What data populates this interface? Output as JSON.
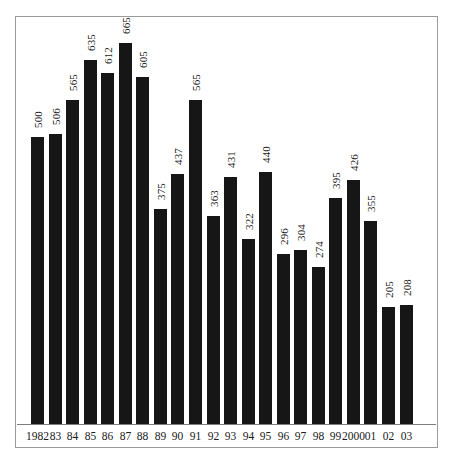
{
  "chart_data": {
    "type": "bar",
    "title": "",
    "subtitle": "",
    "xlabel": "",
    "ylabel": "",
    "grid": false,
    "legend": "none",
    "axis_ranges": {
      "ylim": [
        0,
        700
      ]
    },
    "categories": [
      "1982",
      "83",
      "84",
      "85",
      "86",
      "87",
      "88",
      "89",
      "90",
      "91",
      "92",
      "93",
      "94",
      "95",
      "96",
      "97",
      "98",
      "99",
      "2000",
      "01",
      "02",
      "03"
    ],
    "values": [
      500,
      506,
      565,
      635,
      612,
      665,
      605,
      375,
      437,
      565,
      363,
      431,
      322,
      440,
      296,
      304,
      274,
      395,
      426,
      355,
      205,
      208
    ],
    "data_labels": [
      "500",
      "506",
      "565",
      "635",
      "612",
      "665",
      "605",
      "375",
      "437",
      "565",
      "363",
      "431",
      "322",
      "440",
      "296",
      "304",
      "274",
      "395",
      "426",
      "355",
      "205",
      "208"
    ],
    "bar_color": "#161616",
    "frame_color": "#9a9a9a",
    "background_color": "#ffffff",
    "label_orientation": "vertical"
  }
}
